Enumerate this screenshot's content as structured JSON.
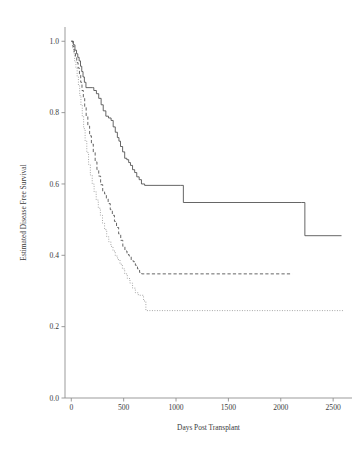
{
  "chart_data": {
    "type": "line",
    "title": "",
    "subtitle": "",
    "xlabel": "Days Post Transplant",
    "ylabel": "Estimated Disease Free Survival",
    "xlim": [
      -60,
      2680
    ],
    "ylim": [
      0.0,
      1.04
    ],
    "xticks": [
      0,
      500,
      1000,
      1500,
      2000,
      2500
    ],
    "xtick_labels": [
      "0",
      "500",
      "1000",
      "1500",
      "2000",
      "2500"
    ],
    "yticks": [
      0.0,
      0.2,
      0.4,
      0.6,
      0.8,
      1.0
    ],
    "ytick_labels": [
      "0.0",
      "0.2",
      "0.4",
      "0.6",
      "0.8",
      "1.0"
    ],
    "grid": false,
    "legend": null,
    "legend_position": "none",
    "step_style": "post",
    "series": [
      {
        "name": "group-1-solid",
        "line_style": "solid",
        "color": "#4a4a4a",
        "x": [
          0,
          20,
          35,
          50,
          62,
          75,
          88,
          100,
          112,
          125,
          140,
          200,
          215,
          240,
          262,
          285,
          305,
          330,
          355,
          380,
          400,
          420,
          440,
          455,
          470,
          490,
          510,
          530,
          548,
          565,
          585,
          605,
          625,
          648,
          670,
          700,
          1040,
          1070,
          2200,
          2230,
          2580
        ],
        "y": [
          1.0,
          0.99,
          0.975,
          0.965,
          0.955,
          0.945,
          0.93,
          0.915,
          0.9,
          0.885,
          0.87,
          0.87,
          0.862,
          0.853,
          0.84,
          0.822,
          0.805,
          0.79,
          0.785,
          0.778,
          0.76,
          0.745,
          0.73,
          0.72,
          0.705,
          0.69,
          0.672,
          0.668,
          0.66,
          0.652,
          0.64,
          0.632,
          0.62,
          0.612,
          0.6,
          0.596,
          0.596,
          0.548,
          0.548,
          0.455,
          0.455
        ]
      },
      {
        "name": "group-2-dashed",
        "line_style": "dashed",
        "color": "#4a4a4a",
        "x": [
          0,
          15,
          28,
          40,
          52,
          65,
          78,
          90,
          102,
          115,
          128,
          142,
          158,
          175,
          192,
          210,
          228,
          245,
          262,
          280,
          300,
          318,
          335,
          352,
          372,
          392,
          412,
          432,
          452,
          472,
          492,
          512,
          532,
          552,
          572,
          592,
          612,
          632,
          652,
          672,
          2110
        ],
        "y": [
          1.0,
          0.985,
          0.97,
          0.955,
          0.94,
          0.925,
          0.905,
          0.885,
          0.862,
          0.84,
          0.815,
          0.79,
          0.762,
          0.735,
          0.712,
          0.688,
          0.662,
          0.64,
          0.622,
          0.598,
          0.578,
          0.572,
          0.558,
          0.545,
          0.528,
          0.512,
          0.495,
          0.478,
          0.46,
          0.442,
          0.425,
          0.412,
          0.402,
          0.398,
          0.385,
          0.382,
          0.372,
          0.362,
          0.352,
          0.348,
          0.348
        ]
      },
      {
        "name": "group-3-dotted",
        "line_style": "dotted",
        "color": "#8d8d8d",
        "x": [
          0,
          12,
          22,
          32,
          44,
          56,
          68,
          80,
          92,
          105,
          118,
          132,
          148,
          165,
          182,
          200,
          218,
          238,
          258,
          278,
          298,
          318,
          338,
          358,
          378,
          398,
          420,
          442,
          465,
          488,
          510,
          535,
          560,
          585,
          612,
          640,
          668,
          690,
          712,
          2600
        ],
        "y": [
          1.0,
          0.982,
          0.965,
          0.945,
          0.925,
          0.9,
          0.875,
          0.848,
          0.82,
          0.79,
          0.755,
          0.72,
          0.688,
          0.655,
          0.625,
          0.6,
          0.578,
          0.555,
          0.532,
          0.512,
          0.49,
          0.472,
          0.452,
          0.438,
          0.425,
          0.412,
          0.398,
          0.388,
          0.375,
          0.362,
          0.348,
          0.335,
          0.322,
          0.308,
          0.295,
          0.288,
          0.288,
          0.272,
          0.245,
          0.245
        ]
      }
    ],
    "plateau_values": {
      "group-1-solid": 0.455,
      "group-2-dashed": 0.348,
      "group-3-dotted": 0.245
    }
  },
  "axes": {
    "x_title": "Days Post Transplant",
    "y_title": "Estimated Disease Free Survival"
  }
}
